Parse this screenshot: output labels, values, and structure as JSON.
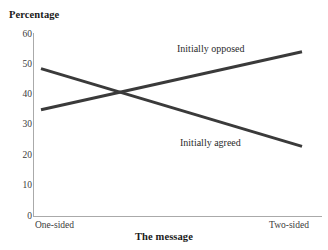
{
  "chart_data": {
    "type": "line",
    "title": "",
    "ylabel": "Percentage",
    "xlabel": "The message",
    "categories": [
      "One-sided",
      "Two-sided"
    ],
    "x": [
      0,
      1
    ],
    "ylim": [
      0,
      60
    ],
    "yticks": [
      60,
      50,
      40,
      30,
      20,
      10,
      0
    ],
    "ytick_labels": [
      "60",
      "50",
      "40",
      "30",
      "20",
      "10",
      "0"
    ],
    "grid": false,
    "legend_position": "inline-annotation",
    "series": [
      {
        "name": "Initially opposed",
        "values": [
          35,
          54
        ],
        "color": "#3a3a3a",
        "annotation": "Initially opposed"
      },
      {
        "name": "Initially agreed",
        "values": [
          48.5,
          23
        ],
        "color": "#3a3a3a",
        "annotation": "Initially agreed"
      }
    ],
    "annotations": [
      "Initially opposed",
      "Initially agreed"
    ],
    "colors": {
      "line": "#3a3a3a",
      "axis": "#aaaaaa",
      "text": "#1a1a1a",
      "background": "#ffffff"
    }
  },
  "axes": {
    "y_title": "Percentage",
    "x_title": "The message",
    "y_ticks": [
      "60",
      "50",
      "40",
      "30",
      "20",
      "10",
      "0"
    ],
    "x_ticks": {
      "left": "One-sided",
      "right": "Two-sided"
    }
  },
  "series_labels": {
    "opposed": "Initially opposed",
    "agreed": "Initially agreed"
  }
}
